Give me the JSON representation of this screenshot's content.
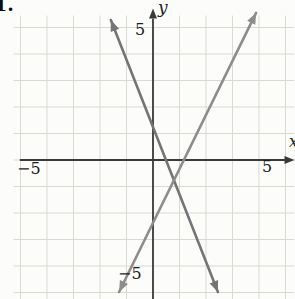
{
  "page": {
    "problem_number": "1."
  },
  "chart_data": {
    "type": "line",
    "title": "",
    "xlabel": "x",
    "ylabel": "y",
    "xlim": [
      -5,
      5
    ],
    "ylim": [
      -5,
      5
    ],
    "grid": true,
    "grid_step": 1,
    "axis_tick_labels": {
      "x_neg": "−5",
      "x_pos": "5",
      "y_pos": "5",
      "y_neg": "−5"
    },
    "series": [
      {
        "name": "steep-negative-slope-line",
        "slope_est": -2.5,
        "y_intercept_est": 1.25,
        "x_intercept_est": 0.5,
        "endpoints": [
          [
            -1.59,
            5.28
          ],
          [
            2.45,
            -4.98
          ]
        ],
        "arrows": "both",
        "color": "#757575"
      },
      {
        "name": "positive-slope-line",
        "slope_est": 2,
        "y_intercept_est": -2.5,
        "x_intercept_est": 1.4,
        "endpoints": [
          [
            -1.28,
            -4.98
          ],
          [
            3.89,
            5.55
          ]
        ],
        "arrows": "both",
        "color": "#8d8d8d"
      }
    ],
    "intersection_est": [
      1,
      -1
    ],
    "axis_color": "#3a3a3a",
    "grid_color": "#ddd9d1",
    "legend": false
  }
}
